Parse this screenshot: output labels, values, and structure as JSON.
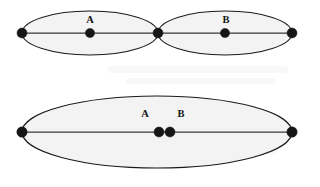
{
  "figure": {
    "canvas": {
      "width": 320,
      "height": 187,
      "background": "#ffffff"
    },
    "style": {
      "ellipse_fill": "#f3f3f3",
      "ellipse_stroke": "#1a1a1a",
      "axis_stroke": "#3a3a3a",
      "vertex_fill": "#161616",
      "label_color": "#141414"
    },
    "panels": [
      {
        "id": "top-panel",
        "name": "two-tangent-ellipses",
        "ellipses": [
          {
            "id": "ellipse-a",
            "name": "left-ellipse",
            "cx": 90,
            "cy": 33,
            "rx": 68,
            "ry": 22
          },
          {
            "id": "ellipse-b",
            "name": "right-ellipse",
            "cx": 225,
            "cy": 33,
            "rx": 67,
            "ry": 22
          }
        ],
        "axes": [
          {
            "id": "axis-left",
            "x1": 22,
            "y1": 33,
            "x2": 158,
            "y2": 33
          },
          {
            "id": "axis-right",
            "x1": 158,
            "y1": 33,
            "x2": 292,
            "y2": 33
          }
        ],
        "vertices": [
          {
            "id": "v-top-left",
            "name": "left-endpoint-vertex",
            "cx": 22,
            "cy": 33,
            "r": 5.0,
            "label": ""
          },
          {
            "id": "v-top-a",
            "name": "vertex-a",
            "cx": 90,
            "cy": 33,
            "r": 4.6,
            "label": "A",
            "label_x": 90,
            "label_y": 23
          },
          {
            "id": "v-top-mid",
            "name": "shared-junction-vertex",
            "cx": 158,
            "cy": 33,
            "r": 5.0,
            "label": ""
          },
          {
            "id": "v-top-b",
            "name": "vertex-b",
            "cx": 225,
            "cy": 33,
            "r": 4.6,
            "label": "B",
            "label_x": 226,
            "label_y": 23
          },
          {
            "id": "v-top-right",
            "name": "right-endpoint-vertex",
            "cx": 292,
            "cy": 33,
            "r": 5.0,
            "label": ""
          }
        ]
      },
      {
        "id": "bottom-panel",
        "name": "single-merged-ellipse",
        "ellipses": [
          {
            "id": "ellipse-merged",
            "name": "merged-ellipse",
            "cx": 157,
            "cy": 132,
            "rx": 135,
            "ry": 36
          }
        ],
        "axes": [
          {
            "id": "axis-merged",
            "x1": 22,
            "y1": 132,
            "x2": 292,
            "y2": 132
          }
        ],
        "vertices": [
          {
            "id": "v-bot-left",
            "name": "left-endpoint-vertex",
            "cx": 22,
            "cy": 132,
            "r": 5.2,
            "label": ""
          },
          {
            "id": "v-bot-a",
            "name": "vertex-a",
            "cx": 159,
            "cy": 132,
            "r": 5.0,
            "label": "A",
            "label_x": 145,
            "label_y": 117
          },
          {
            "id": "v-bot-b",
            "name": "vertex-b",
            "cx": 170,
            "cy": 132,
            "r": 5.0,
            "label": "B",
            "label_x": 181,
            "label_y": 117
          },
          {
            "id": "v-bot-right",
            "name": "right-endpoint-vertex",
            "cx": 292,
            "cy": 132,
            "r": 5.2,
            "label": ""
          }
        ]
      }
    ]
  }
}
